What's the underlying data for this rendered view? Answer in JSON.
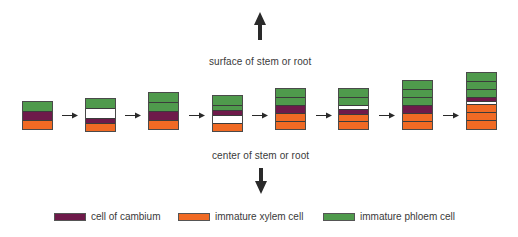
{
  "colors": {
    "cambium": "#6e1a4a",
    "xylem": "#f06a24",
    "phloem": "#4f9a4c",
    "white": "#ffffff",
    "arrow": "#2a2a2a"
  },
  "top_label": "surface of stem or root",
  "bottom_label": "center of stem or root",
  "stacks": [
    {
      "x": 22,
      "top": 101,
      "layers": [
        [
          "phloem",
          9
        ],
        [
          "cambium",
          9
        ],
        [
          "xylem",
          9
        ]
      ]
    },
    {
      "x": 85,
      "top": 98,
      "layers": [
        [
          "phloem",
          9
        ],
        [
          "white",
          10
        ],
        [
          "cambium",
          5
        ],
        [
          "xylem",
          8
        ]
      ]
    },
    {
      "x": 148,
      "top": 92,
      "layers": [
        [
          "phloem",
          9
        ],
        [
          "phloem",
          9
        ],
        [
          "cambium",
          9
        ],
        [
          "xylem",
          9
        ]
      ]
    },
    {
      "x": 212,
      "top": 95,
      "layers": [
        [
          "phloem",
          9
        ],
        [
          "phloem",
          5
        ],
        [
          "cambium",
          5
        ],
        [
          "white",
          8
        ],
        [
          "xylem",
          8
        ]
      ]
    },
    {
      "x": 275,
      "top": 88,
      "layers": [
        [
          "phloem",
          8
        ],
        [
          "phloem",
          8
        ],
        [
          "cambium",
          8
        ],
        [
          "xylem",
          8
        ],
        [
          "xylem",
          8
        ]
      ]
    },
    {
      "x": 338,
      "top": 88,
      "layers": [
        [
          "phloem",
          8
        ],
        [
          "phloem",
          8
        ],
        [
          "white",
          4
        ],
        [
          "cambium",
          5
        ],
        [
          "xylem",
          7
        ],
        [
          "xylem",
          8
        ]
      ]
    },
    {
      "x": 402,
      "top": 80,
      "layers": [
        [
          "phloem",
          8
        ],
        [
          "phloem",
          8
        ],
        [
          "phloem",
          8
        ],
        [
          "cambium",
          8
        ],
        [
          "xylem",
          8
        ],
        [
          "xylem",
          8
        ]
      ]
    },
    {
      "x": 466,
      "top": 72,
      "layers": [
        [
          "phloem",
          8
        ],
        [
          "phloem",
          8
        ],
        [
          "phloem",
          8
        ],
        [
          "cambium",
          4
        ],
        [
          "white",
          3
        ],
        [
          "xylem",
          8
        ],
        [
          "xylem",
          8
        ],
        [
          "xylem",
          9
        ]
      ]
    }
  ],
  "arrows_x": [
    62,
    125,
    189,
    252,
    316,
    379,
    443
  ],
  "legend": [
    {
      "key": "cambium",
      "label": "cell of cambium"
    },
    {
      "key": "xylem",
      "label": "immature xylem cell"
    },
    {
      "key": "phloem",
      "label": "immature phloem cell"
    }
  ]
}
